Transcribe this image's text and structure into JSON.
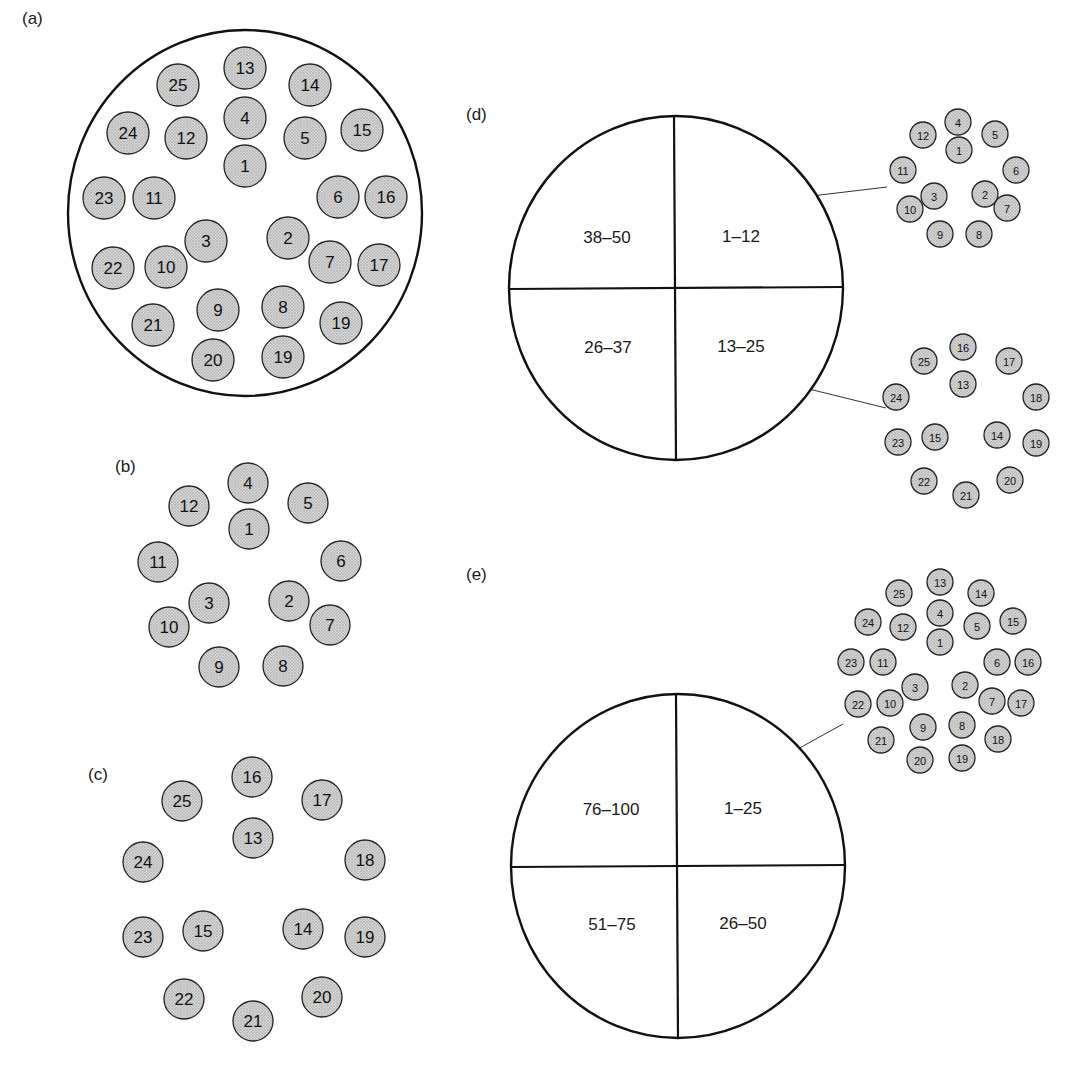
{
  "figure": {
    "panels": [
      {
        "id": "a",
        "label": "(a)",
        "label_pos": [
          22,
          24
        ],
        "container": {
          "cx": 245,
          "cy": 213,
          "rx": 177,
          "ry": 183
        },
        "fiber_radius": 21,
        "font_size": 17,
        "fibers": [
          {
            "n": "13",
            "x": 245,
            "y": 68
          },
          {
            "n": "25",
            "x": 178,
            "y": 85
          },
          {
            "n": "14",
            "x": 310,
            "y": 85
          },
          {
            "n": "4",
            "x": 245,
            "y": 118
          },
          {
            "n": "24",
            "x": 128,
            "y": 133
          },
          {
            "n": "12",
            "x": 186,
            "y": 138
          },
          {
            "n": "5",
            "x": 305,
            "y": 138
          },
          {
            "n": "15",
            "x": 362,
            "y": 130
          },
          {
            "n": "1",
            "x": 245,
            "y": 166
          },
          {
            "n": "23",
            "x": 104,
            "y": 198
          },
          {
            "n": "11",
            "x": 154,
            "y": 198
          },
          {
            "n": "6",
            "x": 338,
            "y": 197
          },
          {
            "n": "16",
            "x": 386,
            "y": 197
          },
          {
            "n": "3",
            "x": 206,
            "y": 241
          },
          {
            "n": "2",
            "x": 288,
            "y": 238
          },
          {
            "n": "22",
            "x": 113,
            "y": 268
          },
          {
            "n": "10",
            "x": 166,
            "y": 267
          },
          {
            "n": "7",
            "x": 330,
            "y": 262
          },
          {
            "n": "17",
            "x": 379,
            "y": 265
          },
          {
            "n": "9",
            "x": 218,
            "y": 310
          },
          {
            "n": "8",
            "x": 283,
            "y": 307
          },
          {
            "n": "19",
            "x": 341,
            "y": 323
          },
          {
            "n": "21",
            "x": 153,
            "y": 325
          },
          {
            "n": "20",
            "x": 213,
            "y": 360
          },
          {
            "n": "19",
            "x": 283,
            "y": 357
          }
        ]
      },
      {
        "id": "b",
        "label": "(b)",
        "label_pos": [
          115,
          472
        ],
        "fiber_radius": 20,
        "font_size": 17,
        "fibers": [
          {
            "n": "4",
            "x": 248,
            "y": 483
          },
          {
            "n": "12",
            "x": 189,
            "y": 506
          },
          {
            "n": "5",
            "x": 308,
            "y": 503
          },
          {
            "n": "1",
            "x": 249,
            "y": 529
          },
          {
            "n": "11",
            "x": 158,
            "y": 562
          },
          {
            "n": "6",
            "x": 341,
            "y": 561
          },
          {
            "n": "3",
            "x": 209,
            "y": 603
          },
          {
            "n": "2",
            "x": 289,
            "y": 601
          },
          {
            "n": "10",
            "x": 169,
            "y": 627
          },
          {
            "n": "7",
            "x": 330,
            "y": 625
          },
          {
            "n": "9",
            "x": 219,
            "y": 667
          },
          {
            "n": "8",
            "x": 283,
            "y": 666
          }
        ]
      },
      {
        "id": "c",
        "label": "(c)",
        "label_pos": [
          88,
          780
        ],
        "fiber_radius": 20,
        "font_size": 17,
        "fibers": [
          {
            "n": "16",
            "x": 252,
            "y": 777
          },
          {
            "n": "25",
            "x": 182,
            "y": 801
          },
          {
            "n": "17",
            "x": 322,
            "y": 800
          },
          {
            "n": "13",
            "x": 253,
            "y": 838
          },
          {
            "n": "24",
            "x": 143,
            "y": 862
          },
          {
            "n": "18",
            "x": 365,
            "y": 860
          },
          {
            "n": "15",
            "x": 203,
            "y": 931
          },
          {
            "n": "14",
            "x": 303,
            "y": 929
          },
          {
            "n": "23",
            "x": 143,
            "y": 937
          },
          {
            "n": "19",
            "x": 365,
            "y": 937
          },
          {
            "n": "22",
            "x": 184,
            "y": 999
          },
          {
            "n": "20",
            "x": 322,
            "y": 997
          },
          {
            "n": "21",
            "x": 253,
            "y": 1021
          }
        ]
      },
      {
        "id": "d",
        "label": "(d)",
        "label_pos": [
          466,
          120
        ],
        "cable": {
          "cx": 676,
          "cy": 288,
          "rx": 167,
          "ry": 172,
          "quadrants": [
            {
              "text": "38–50",
              "x": 607,
              "y": 237
            },
            {
              "text": "1–12",
              "x": 741,
              "y": 236
            },
            {
              "text": "26–37",
              "x": 608,
              "y": 347
            },
            {
              "text": "13–25",
              "x": 741,
              "y": 346
            }
          ]
        },
        "fiber_radius": 13,
        "font_size": 11,
        "groups": [
          {
            "name": "quadrant-1-12",
            "leader": [
              753,
              203,
              887,
              187
            ],
            "fibers": [
              {
                "n": "4",
                "x": 958,
                "y": 122
              },
              {
                "n": "12",
                "x": 923,
                "y": 135
              },
              {
                "n": "5",
                "x": 995,
                "y": 134
              },
              {
                "n": "1",
                "x": 959,
                "y": 150
              },
              {
                "n": "11",
                "x": 903,
                "y": 170
              },
              {
                "n": "6",
                "x": 1016,
                "y": 170
              },
              {
                "n": "3",
                "x": 934,
                "y": 196
              },
              {
                "n": "2",
                "x": 985,
                "y": 194
              },
              {
                "n": "10",
                "x": 910,
                "y": 209
              },
              {
                "n": "7",
                "x": 1007,
                "y": 208
              },
              {
                "n": "9",
                "x": 940,
                "y": 234
              },
              {
                "n": "8",
                "x": 979,
                "y": 234
              }
            ]
          },
          {
            "name": "quadrant-13-25",
            "leader": [
              752,
              375,
              886,
              408
            ],
            "fibers": [
              {
                "n": "16",
                "x": 963,
                "y": 347
              },
              {
                "n": "25",
                "x": 924,
                "y": 361
              },
              {
                "n": "17",
                "x": 1009,
                "y": 361
              },
              {
                "n": "13",
                "x": 963,
                "y": 384
              },
              {
                "n": "24",
                "x": 896,
                "y": 397
              },
              {
                "n": "18",
                "x": 1036,
                "y": 397
              },
              {
                "n": "15",
                "x": 935,
                "y": 437
              },
              {
                "n": "14",
                "x": 997,
                "y": 435
              },
              {
                "n": "23",
                "x": 898,
                "y": 442
              },
              {
                "n": "19",
                "x": 1036,
                "y": 443
              },
              {
                "n": "22",
                "x": 924,
                "y": 481
              },
              {
                "n": "20",
                "x": 1010,
                "y": 480
              },
              {
                "n": "21",
                "x": 966,
                "y": 495
              }
            ]
          }
        ]
      },
      {
        "id": "e",
        "label": "(e)",
        "label_pos": [
          466,
          580
        ],
        "cable": {
          "cx": 678,
          "cy": 866,
          "rx": 167,
          "ry": 172,
          "quadrants": [
            {
              "text": "76–100",
              "x": 611,
              "y": 809
            },
            {
              "text": "1–25",
              "x": 743,
              "y": 808
            },
            {
              "text": "51–75",
              "x": 612,
              "y": 924
            },
            {
              "text": "26–50",
              "x": 743,
              "y": 923
            }
          ]
        },
        "fiber_radius": 13,
        "font_size": 11,
        "groups": [
          {
            "name": "quadrant-1-25",
            "leader": [
              749,
              776,
              843,
              724
            ],
            "fibers": [
              {
                "n": "13",
                "x": 940,
                "y": 582
              },
              {
                "n": "25",
                "x": 899,
                "y": 593
              },
              {
                "n": "14",
                "x": 981,
                "y": 593
              },
              {
                "n": "4",
                "x": 940,
                "y": 613
              },
              {
                "n": "24",
                "x": 868,
                "y": 622
              },
              {
                "n": "12",
                "x": 903,
                "y": 627
              },
              {
                "n": "5",
                "x": 977,
                "y": 626
              },
              {
                "n": "15",
                "x": 1013,
                "y": 621
              },
              {
                "n": "1",
                "x": 940,
                "y": 642
              },
              {
                "n": "23",
                "x": 851,
                "y": 662
              },
              {
                "n": "11",
                "x": 883,
                "y": 662
              },
              {
                "n": "6",
                "x": 997,
                "y": 662
              },
              {
                "n": "16",
                "x": 1028,
                "y": 662
              },
              {
                "n": "3",
                "x": 915,
                "y": 687
              },
              {
                "n": "2",
                "x": 965,
                "y": 685
              },
              {
                "n": "22",
                "x": 858,
                "y": 704
              },
              {
                "n": "10",
                "x": 890,
                "y": 703
              },
              {
                "n": "7",
                "x": 992,
                "y": 701
              },
              {
                "n": "17",
                "x": 1021,
                "y": 703
              },
              {
                "n": "9",
                "x": 923,
                "y": 727
              },
              {
                "n": "8",
                "x": 962,
                "y": 725
              },
              {
                "n": "18",
                "x": 998,
                "y": 739
              },
              {
                "n": "21",
                "x": 881,
                "y": 740
              },
              {
                "n": "20",
                "x": 920,
                "y": 760
              },
              {
                "n": "19",
                "x": 962,
                "y": 758
              }
            ]
          }
        ]
      }
    ],
    "colors": {
      "fiber_fill": "#cfcfcf",
      "fiber_dot": "#9a9a9a",
      "stroke": "#111111",
      "background": "#ffffff"
    }
  }
}
